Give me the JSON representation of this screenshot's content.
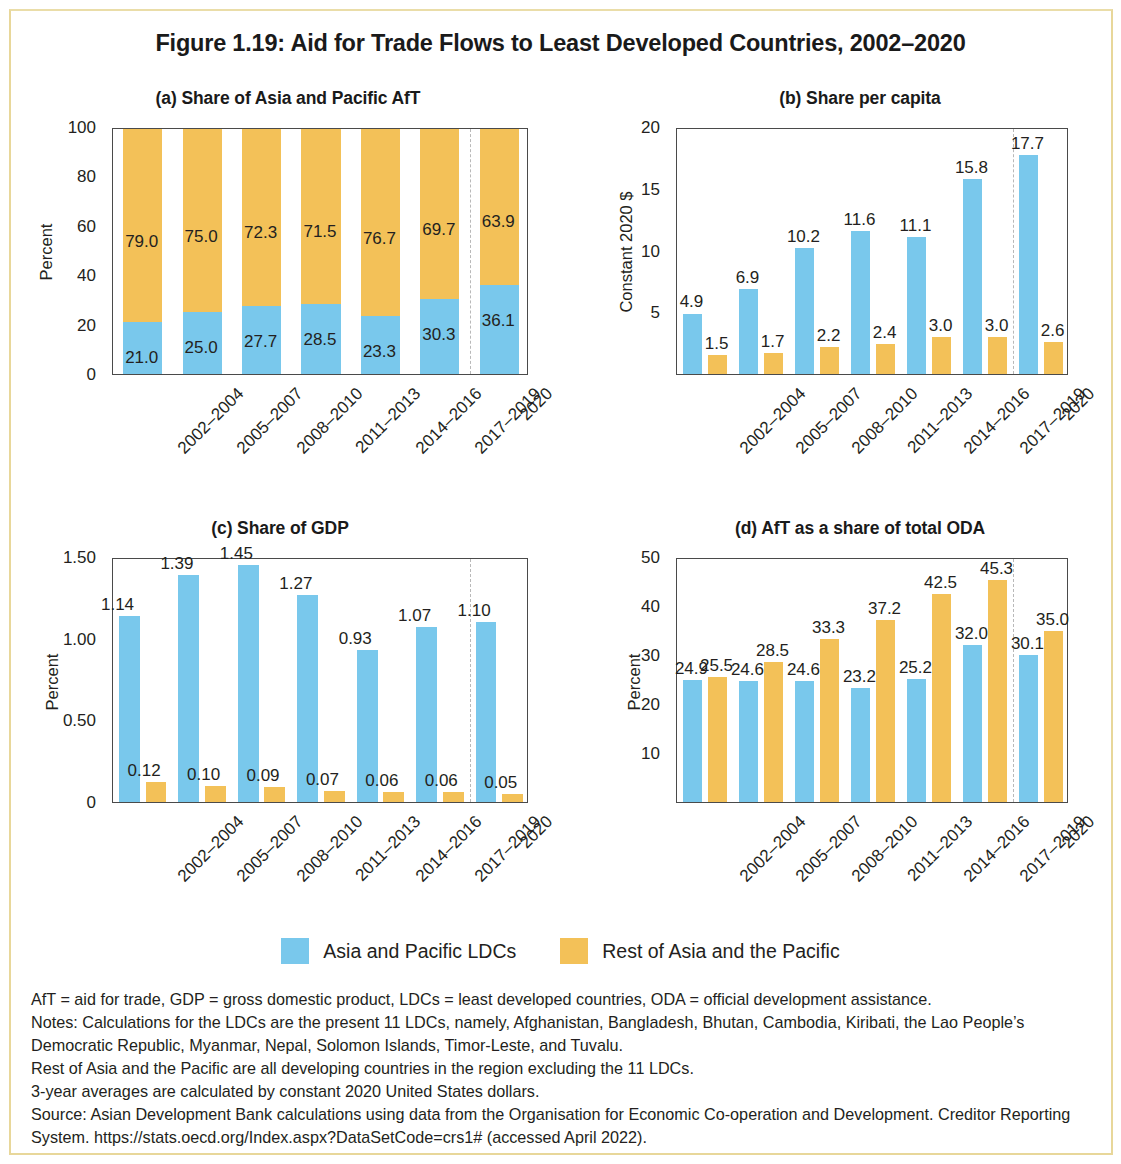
{
  "figure": {
    "title": "Figure 1.19: Aid for Trade Flows to Least Developed Countries, 2002–2020"
  },
  "legend": {
    "items": [
      {
        "label": "Asia and Pacific LDCs",
        "color": "#79c8ec",
        "key": "ldc"
      },
      {
        "label": "Rest of Asia and the Pacific",
        "color": "#f3c158",
        "key": "rest"
      }
    ]
  },
  "notes": {
    "lines": [
      "AfT = aid for trade, GDP = gross domestic product, LDCs = least developed countries, ODA = official development assistance.",
      "Notes: Calculations for the LDCs are the present 11 LDCs, namely, Afghanistan, Bangladesh, Bhutan, Cambodia, Kiribati, the Lao People’s Democratic Republic, Myanmar, Nepal, Solomon Islands, Timor-Leste, and Tuvalu.",
      "Rest of Asia and the Pacific are all developing countries in the region excluding the 11 LDCs.",
      "3-year averages are calculated by constant 2020 United States dollars.",
      "Source: Asian Development Bank calculations using data from the Organisation for Economic Co-operation and Development. Creditor Reporting System. https://stats.oecd.org/Index.aspx?DataSetCode=crs1# (accessed April 2022)."
    ]
  },
  "chart_data": [
    {
      "id": "a",
      "type": "bar",
      "stacked": true,
      "title": "(a) Share of Asia and Pacific AfT",
      "xlabel": "",
      "ylabel": "Percent",
      "ylim": [
        0,
        100
      ],
      "yticks": [
        0,
        20,
        40,
        60,
        80,
        100
      ],
      "ytick_labels": [
        "0",
        "20",
        "40",
        "60",
        "80",
        "100"
      ],
      "grid": false,
      "legend_position": "bottom-shared",
      "categories": [
        "2002–2004",
        "2005–2007",
        "2008–2010",
        "2011–2013",
        "2014–2016",
        "2017–2019",
        "2020"
      ],
      "series": [
        {
          "name": "Asia and Pacific LDCs",
          "color": "#79c8ec",
          "values": [
            21.0,
            25.0,
            27.7,
            28.5,
            23.3,
            30.3,
            36.1
          ],
          "labels": [
            "21.0",
            "25.0",
            "27.7",
            "28.5",
            "23.3",
            "30.3",
            "36.1"
          ]
        },
        {
          "name": "Rest of Asia and the Pacific",
          "color": "#f3c158",
          "values": [
            79.0,
            75.0,
            72.3,
            71.5,
            76.7,
            69.7,
            63.9
          ],
          "labels": [
            "79.0",
            "75.0",
            "72.3",
            "71.5",
            "76.7",
            "69.7",
            "63.9"
          ]
        }
      ],
      "separator_after_category_index": 5
    },
    {
      "id": "b",
      "type": "bar",
      "stacked": false,
      "title": "(b) Share per capita",
      "xlabel": "",
      "ylabel": "Constant 2020 $",
      "ylim": [
        0,
        20
      ],
      "yticks": [
        5,
        10,
        15,
        20
      ],
      "ytick_labels": [
        "5",
        "10",
        "15",
        "20"
      ],
      "grid": false,
      "legend_position": "bottom-shared",
      "categories": [
        "2002–2004",
        "2005–2007",
        "2008–2010",
        "2011–2013",
        "2014–2016",
        "2017–2019",
        "2020"
      ],
      "series": [
        {
          "name": "Asia and Pacific LDCs",
          "color": "#79c8ec",
          "values": [
            4.9,
            6.9,
            10.2,
            11.6,
            11.1,
            15.8,
            17.7
          ],
          "labels": [
            "4.9",
            "6.9",
            "10.2",
            "11.6",
            "11.1",
            "15.8",
            "17.7"
          ]
        },
        {
          "name": "Rest of Asia and the Pacific",
          "color": "#f3c158",
          "values": [
            1.5,
            1.7,
            2.2,
            2.4,
            3.0,
            3.0,
            2.6
          ],
          "labels": [
            "1.5",
            "1.7",
            "2.2",
            "2.4",
            "3.0",
            "3.0",
            "2.6"
          ]
        }
      ],
      "separator_after_category_index": 5
    },
    {
      "id": "c",
      "type": "bar",
      "stacked": false,
      "title": "(c) Share of GDP",
      "xlabel": "",
      "ylabel": "Percent",
      "ylim": [
        0,
        1.5
      ],
      "yticks": [
        0,
        0.5,
        1.0,
        1.5
      ],
      "ytick_labels": [
        "0",
        "0.50",
        "1.00",
        "1.50"
      ],
      "grid": false,
      "legend_position": "bottom-shared",
      "categories": [
        "2002–2004",
        "2005–2007",
        "2008–2010",
        "2011–2013",
        "2014–2016",
        "2017–2019",
        "2020"
      ],
      "series": [
        {
          "name": "Asia and Pacific LDCs",
          "color": "#79c8ec",
          "values": [
            1.14,
            1.39,
            1.45,
            1.27,
            0.93,
            1.07,
            1.1
          ],
          "labels": [
            "1.14",
            "1.39",
            "1.45",
            "1.27",
            "0.93",
            "1.07",
            "1.10"
          ]
        },
        {
          "name": "Rest of Asia and the Pacific",
          "color": "#f3c158",
          "values": [
            0.12,
            0.1,
            0.09,
            0.07,
            0.06,
            0.06,
            0.05
          ],
          "labels": [
            "0.12",
            "0.10",
            "0.09",
            "0.07",
            "0.06",
            "0.06",
            "0.05"
          ]
        }
      ],
      "separator_after_category_index": 5
    },
    {
      "id": "d",
      "type": "bar",
      "stacked": false,
      "title": "(d) AfT as a share of total ODA",
      "xlabel": "",
      "ylabel": "Percent",
      "ylim": [
        0,
        50
      ],
      "yticks": [
        10,
        20,
        30,
        40,
        50
      ],
      "ytick_labels": [
        "10",
        "20",
        "30",
        "40",
        "50"
      ],
      "grid": false,
      "legend_position": "bottom-shared",
      "categories": [
        "2002–2004",
        "2005–2007",
        "2008–2010",
        "2011–2013",
        "2014–2016",
        "2017–2019",
        "2020"
      ],
      "series": [
        {
          "name": "Asia and Pacific LDCs",
          "color": "#79c8ec",
          "values": [
            24.9,
            24.6,
            24.6,
            23.2,
            25.2,
            32.0,
            30.1
          ],
          "labels": [
            "24.9",
            "24.6",
            "24.6",
            "23.2",
            "25.2",
            "32.0",
            "30.1"
          ]
        },
        {
          "name": "Rest of Asia and the Pacific",
          "color": "#f3c158",
          "values": [
            25.5,
            28.5,
            33.3,
            37.2,
            42.5,
            45.3,
            35.0
          ],
          "labels": [
            "25.5",
            "28.5",
            "33.3",
            "37.2",
            "42.5",
            "45.3",
            "35.0"
          ]
        }
      ],
      "separator_after_category_index": 5
    }
  ]
}
